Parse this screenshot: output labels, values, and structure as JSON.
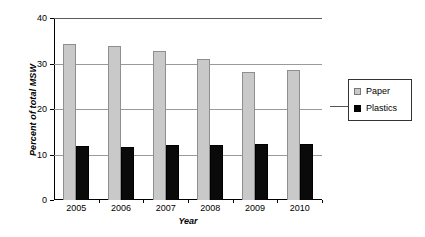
{
  "chart_data": {
    "type": "bar",
    "title": "",
    "subtitle": "",
    "xlabel": "Year",
    "ylabel": "Percent of total MSW",
    "categories": [
      "2005",
      "2006",
      "2007",
      "2008",
      "2009",
      "2010"
    ],
    "series": [
      {
        "name": "Paper",
        "color": "#c9c9c9",
        "values": [
          34.2,
          33.9,
          32.7,
          31.0,
          28.2,
          28.5
        ]
      },
      {
        "name": "Plastics",
        "color": "#000000",
        "values": [
          11.8,
          11.7,
          12.1,
          12.0,
          12.3,
          12.4
        ]
      }
    ],
    "ylim": [
      0,
      40
    ],
    "ytick_labels": [
      "0",
      "10",
      "20",
      "30",
      "40"
    ],
    "ytick_values": [
      0,
      10,
      20,
      30,
      40
    ],
    "grid": "horizontal",
    "legend_position": "right",
    "legend_entries": [
      "Paper",
      "Plastics"
    ]
  }
}
